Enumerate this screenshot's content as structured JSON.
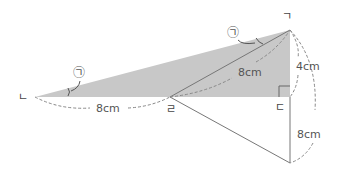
{
  "diagram": {
    "vertices": {
      "top": {
        "label": "ㄱ",
        "x": 290,
        "y": 30
      },
      "left": {
        "label": "ㄴ",
        "x": 35,
        "y": 97
      },
      "foot": {
        "label": "ㄷ",
        "x": 290,
        "y": 97
      },
      "mid": {
        "label": "ㄹ",
        "x": 170,
        "y": 97
      },
      "bottom": {
        "label": "",
        "x": 290,
        "y": 163
      }
    },
    "angle_label": "㉠",
    "lengths": {
      "left_mid": "8cm",
      "mid_top": "8cm",
      "top_foot": "4cm",
      "foot_bottom": "8cm"
    },
    "colors": {
      "shade": "#c8c8c8",
      "line": "#777777",
      "dash": "#888888"
    }
  }
}
